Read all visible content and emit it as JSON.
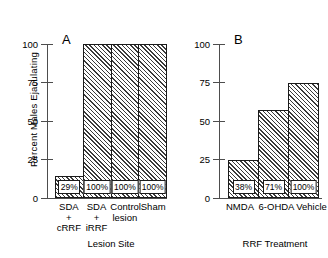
{
  "chart_data": {
    "type": "bar",
    "title": "",
    "ylabel": "Percent Males Ejaculating",
    "ylim": [
      0,
      100
    ],
    "yticks": [
      "0",
      "25",
      "50",
      "75",
      "100"
    ],
    "grid": false,
    "legend": "none",
    "panels": [
      {
        "letter": "A",
        "xlabel": "Lesion Site",
        "categories": [
          {
            "line1": "SDA",
            "line2": "+",
            "line3": "cRRF"
          },
          {
            "line1": "SDA",
            "line2": "+",
            "line3": "iRRF"
          },
          {
            "line1": "Control",
            "line2": "lesion",
            "line3": ""
          },
          {
            "line1": "Sham",
            "line2": "",
            "line3": ""
          }
        ],
        "values": [
          14,
          100,
          100,
          100
        ],
        "value_labels": [
          "29%",
          "100%",
          "100%",
          "100%"
        ]
      },
      {
        "letter": "B",
        "xlabel": "RRF Treatment",
        "categories": [
          {
            "line1": "NMDA",
            "line2": "",
            "line3": ""
          },
          {
            "line1": "6-OHDA",
            "line2": "",
            "line3": ""
          },
          {
            "line1": "Vehicle",
            "line2": "",
            "line3": ""
          }
        ],
        "values": [
          25,
          57,
          75
        ],
        "value_labels": [
          "38%",
          "71%",
          "100%"
        ]
      }
    ]
  },
  "colors": {
    "axis": "#4d4d4d",
    "bar_outline": "#1a1a1a",
    "hatch": "#3a3a3a",
    "background": "#ffffff"
  }
}
